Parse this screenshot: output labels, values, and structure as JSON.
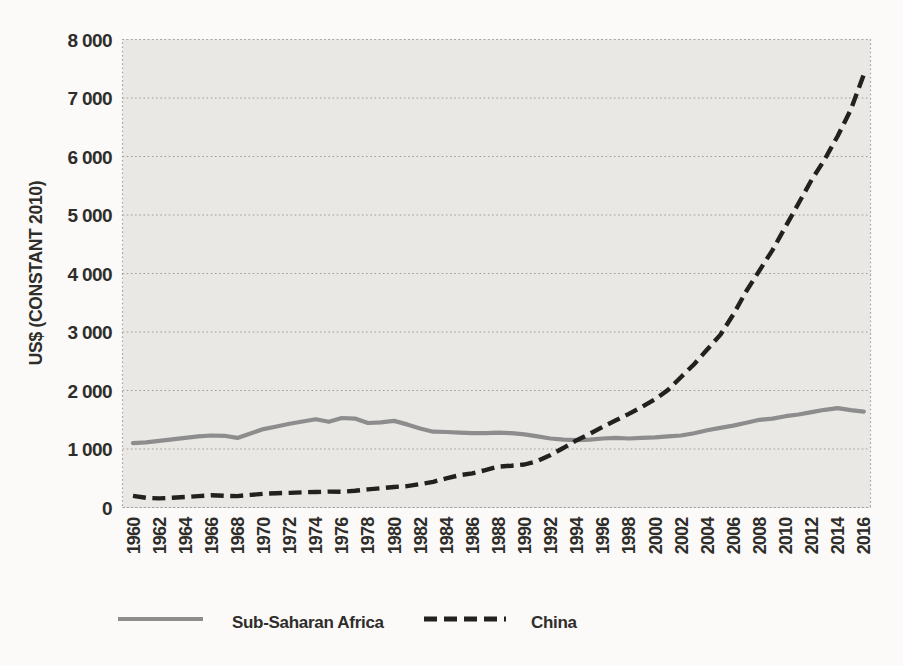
{
  "figure": {
    "background": "#fbfaf8",
    "plot_background": "#e9e8e5",
    "gridline_color": "#9d9d9b",
    "border_color": "#a6a6a4",
    "text_color": "#2e2d2a"
  },
  "chart_data": {
    "type": "line",
    "title": "",
    "xlabel": "",
    "ylabel": "US$ (CONSTANT 2010)",
    "ylim": [
      0,
      8000
    ],
    "y_tick_step": 1000,
    "y_tick_labels": [
      "0",
      "1 000",
      "2 000",
      "3 000",
      "4 000",
      "5 000",
      "6 000",
      "7 000",
      "8 000"
    ],
    "grid": "horizontal dotted",
    "legend_position": "bottom",
    "x": [
      1960,
      1961,
      1962,
      1963,
      1964,
      1965,
      1966,
      1967,
      1968,
      1969,
      1970,
      1971,
      1972,
      1973,
      1974,
      1975,
      1976,
      1977,
      1978,
      1979,
      1980,
      1981,
      1982,
      1983,
      1984,
      1985,
      1986,
      1987,
      1988,
      1989,
      1990,
      1991,
      1992,
      1993,
      1994,
      1995,
      1996,
      1997,
      1998,
      1999,
      2000,
      2001,
      2002,
      2003,
      2004,
      2005,
      2006,
      2007,
      2008,
      2009,
      2010,
      2011,
      2012,
      2013,
      2014,
      2015,
      2016
    ],
    "x_ticks": [
      1960,
      1962,
      1964,
      1966,
      1968,
      1970,
      1972,
      1974,
      1976,
      1978,
      1980,
      1982,
      1984,
      1986,
      1988,
      1990,
      1992,
      1994,
      1996,
      1998,
      2000,
      2002,
      2004,
      2006,
      2008,
      2010,
      2012,
      2014,
      2016
    ],
    "series": [
      {
        "name": "Sub-Saharan Africa",
        "line_style": "solid",
        "color": "#8d8d8d",
        "values": [
          1100,
          1115,
          1140,
          1165,
          1190,
          1215,
          1230,
          1225,
          1190,
          1265,
          1340,
          1385,
          1430,
          1470,
          1510,
          1465,
          1530,
          1520,
          1445,
          1455,
          1480,
          1420,
          1350,
          1295,
          1290,
          1280,
          1270,
          1270,
          1280,
          1270,
          1250,
          1215,
          1180,
          1160,
          1150,
          1160,
          1180,
          1190,
          1180,
          1190,
          1200,
          1215,
          1230,
          1270,
          1320,
          1360,
          1400,
          1450,
          1500,
          1520,
          1560,
          1590,
          1630,
          1670,
          1700,
          1665,
          1640
        ]
      },
      {
        "name": "China",
        "line_style": "dashed",
        "color": "#222120",
        "values": [
          200,
          165,
          155,
          165,
          180,
          195,
          210,
          200,
          195,
          215,
          235,
          245,
          250,
          260,
          265,
          272,
          268,
          285,
          310,
          330,
          350,
          365,
          400,
          440,
          500,
          550,
          585,
          640,
          700,
          715,
          735,
          795,
          900,
          1020,
          1150,
          1260,
          1380,
          1490,
          1600,
          1720,
          1850,
          2010,
          2230,
          2450,
          2700,
          2950,
          3300,
          3700,
          4050,
          4400,
          4800,
          5200,
          5600,
          5950,
          6350,
          6800,
          7400
        ]
      }
    ]
  }
}
